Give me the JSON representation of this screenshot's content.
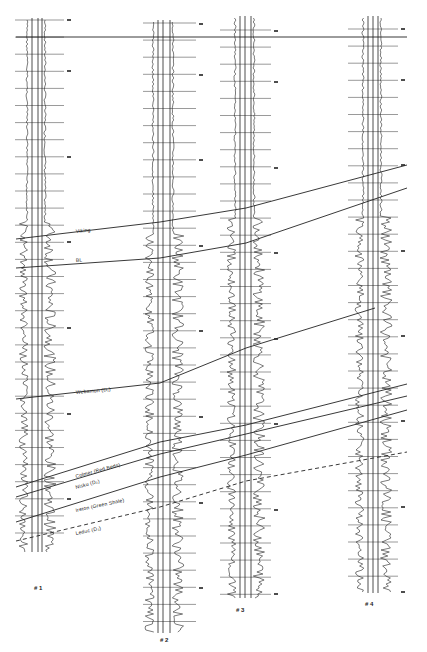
{
  "figure": {
    "title": "",
    "type": "well-log cross-section correlation",
    "background": "#ffffff",
    "ink": "#222222",
    "datum_y": 37,
    "datum_x": [
      16,
      407
    ]
  },
  "wells": [
    {
      "id": "well-1",
      "label": "# 1",
      "label_x": 34,
      "label_y": 590,
      "track_x": [
        32,
        38,
        42
      ],
      "top": 18,
      "bottom": 552,
      "tick_x": [
        15,
        64
      ],
      "tick_start": 20,
      "tick_step": 17.1,
      "depth_marks": [
        20,
        71,
        157,
        242,
        328,
        414,
        499
      ]
    },
    {
      "id": "well-2",
      "label": "# 2",
      "label_x": 160,
      "label_y": 642,
      "track_x": [
        158,
        163,
        170
      ],
      "top": 20,
      "bottom": 633,
      "tick_x": [
        143,
        196
      ],
      "tick_start": 23,
      "tick_step": 17.1,
      "depth_marks": [
        24,
        75,
        160,
        246,
        331,
        417,
        503,
        588
      ]
    },
    {
      "id": "well-3",
      "label": "# 3",
      "label_x": 236,
      "label_y": 612,
      "track_x": [
        240,
        245,
        251
      ],
      "top": 16,
      "bottom": 598,
      "tick_x": [
        220,
        271
      ],
      "tick_start": 30,
      "tick_step": 17.1,
      "depth_marks": [
        31,
        82,
        168,
        253,
        339,
        424,
        510,
        594
      ]
    },
    {
      "id": "well-4",
      "label": "# 4",
      "label_x": 365,
      "label_y": 606,
      "track_x": [
        368,
        373,
        378
      ],
      "top": 16,
      "bottom": 593,
      "tick_x": [
        348,
        398
      ],
      "tick_start": 29,
      "tick_step": 17.1,
      "depth_marks": [
        29,
        80,
        165,
        251,
        336,
        421,
        507,
        592
      ]
    }
  ],
  "horizons": [
    {
      "name": "Viking",
      "style": "solid",
      "label_x": 76,
      "label_y": 233,
      "points": [
        [
          16,
          239
        ],
        [
          160,
          222
        ],
        [
          246,
          208
        ],
        [
          407,
          165
        ]
      ]
    },
    {
      "name": "BL",
      "style": "solid",
      "label_x": 76,
      "label_y": 262,
      "points": [
        [
          16,
          268
        ],
        [
          160,
          258
        ],
        [
          246,
          243
        ],
        [
          407,
          188
        ]
      ]
    },
    {
      "name": "Webamun (D₁)",
      "style": "solid",
      "label_x": 76,
      "label_y": 394,
      "points": [
        [
          16,
          399
        ],
        [
          160,
          383
        ],
        [
          246,
          348
        ],
        [
          375,
          308
        ]
      ]
    },
    {
      "name": "Colmer (Red Beds)",
      "style": "solid",
      "label_x": 76,
      "label_y": 478,
      "points": [
        [
          16,
          487
        ],
        [
          160,
          442
        ],
        [
          246,
          425
        ],
        [
          407,
          384
        ]
      ]
    },
    {
      "name": "Nisku (D₂)",
      "style": "solid",
      "label_x": 76,
      "label_y": 489,
      "points": [
        [
          16,
          497
        ],
        [
          160,
          454
        ],
        [
          246,
          434
        ],
        [
          407,
          396
        ]
      ]
    },
    {
      "name": "Ireton (Green Shale)",
      "style": "solid",
      "label_x": 76,
      "label_y": 512,
      "points": [
        [
          16,
          522
        ],
        [
          160,
          477
        ],
        [
          246,
          455
        ],
        [
          407,
          410
        ]
      ]
    },
    {
      "name": "Leduc (D₃)",
      "style": "dashed",
      "label_x": 76,
      "label_y": 535,
      "points": [
        [
          16,
          541
        ],
        [
          160,
          507
        ],
        [
          246,
          481
        ],
        [
          407,
          452
        ]
      ]
    }
  ],
  "labels": {
    "viking": "Viking",
    "bl": "BL",
    "wabamun": "Webamun (D₁)",
    "colmer": "Colmer (Red Beds)",
    "nisku": "Nisku (D₂)",
    "ireton": "Ireton (Green Shale)",
    "leduc": "Leduc (D₃)",
    "well1": "# 1",
    "well2": "# 2",
    "well3": "# 3",
    "well4": "# 4"
  }
}
